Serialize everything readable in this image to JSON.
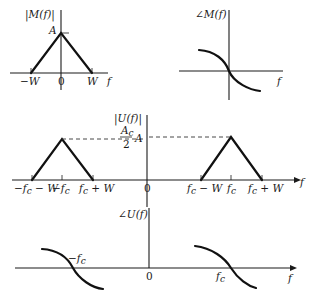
{
  "panels": {
    "m_mag": {
      "ylabel": "|M(f)|",
      "peak_label": "A",
      "xlabel": "f",
      "ticks": [
        "−W",
        "0",
        "W"
      ]
    },
    "m_phase": {
      "ylabel": "∠M(f)",
      "xlabel": "f"
    },
    "u_mag": {
      "ylabel": "|U(f)|",
      "peak_label_num": "A",
      "peak_label_num_sub": "c",
      "peak_label_den": "2",
      "peak_label_suffix": "A",
      "xlabel": "f",
      "ticks": [
        "−f_c − W",
        "−f_c",
        "f_c + W",
        "0",
        "f_c − W",
        "f_c",
        "f_c + W"
      ],
      "tick_text": {
        "neg_fc_minus_w": "−f",
        "neg_fc_minus_w_tail": " − W",
        "neg_fc": "−f",
        "fc_plus_w_left": "f",
        "fc_plus_w_left_tail": " + W",
        "zero": "0",
        "fc_minus_w": "f",
        "fc_minus_w_tail": " − W",
        "fc": "f",
        "fc_plus_w_right": "f",
        "fc_plus_w_right_tail": " + W",
        "sub": "c"
      }
    },
    "u_phase": {
      "ylabel": "∠U(f)",
      "xlabel": "f",
      "neg_fc_label": "−f",
      "fc_label": "f",
      "sub": "c",
      "zero": "0"
    }
  },
  "colors": {
    "ink": "#1a1a1a",
    "background": "#ffffff"
  }
}
